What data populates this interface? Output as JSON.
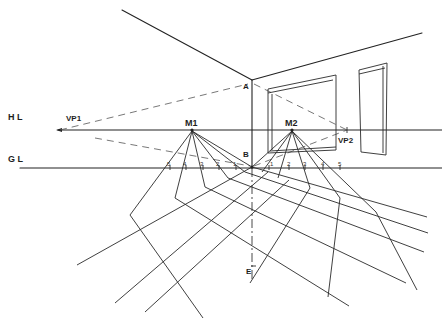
{
  "diagram": {
    "labels": {
      "horizon_line": "H L",
      "ground_line": "G L",
      "vanishing_point_left": "VP1",
      "vanishing_point_right": "VP2",
      "measuring_point_left": "M1",
      "measuring_point_right": "M2",
      "corner_top": "A",
      "corner_bottom": "B",
      "eye_point": "E"
    },
    "ground_line_ticks_left": [
      "5",
      "4",
      "3",
      "2",
      "1"
    ],
    "ground_line_ticks_right": [
      "1",
      "2",
      "3",
      "4",
      "5"
    ],
    "colors": {
      "ink": "#222222",
      "paper": "#ffffff"
    }
  }
}
